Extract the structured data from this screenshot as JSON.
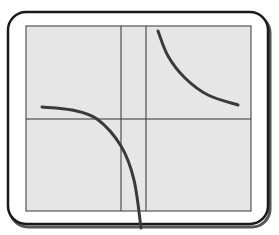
{
  "figure": {
    "title": "",
    "colors": {
      "frame": "#1a1a1a",
      "panel_fill": "#e6e6e6",
      "grid_line": "#333333",
      "curve": "#3a3a3a",
      "background": "#ffffff"
    },
    "frame": {
      "x": 8,
      "y": 12,
      "width": 260,
      "height": 212,
      "radius": 18
    },
    "panel": {
      "x": 26,
      "y": 26,
      "width": 225,
      "height": 185
    },
    "grid_lines": {
      "vertical_x": [
        121,
        146
      ],
      "horizontal_y": [
        119
      ]
    },
    "curves": [
      {
        "name": "upper-right-branch",
        "points": [
          [
            158,
            31
          ],
          [
            168,
            56
          ],
          [
            185,
            78
          ],
          [
            208,
            95
          ],
          [
            238,
            105
          ]
        ]
      },
      {
        "name": "lower-left-branch",
        "points": [
          [
            42,
            107
          ],
          [
            72,
            110
          ],
          [
            97,
            119
          ],
          [
            121,
            146
          ],
          [
            134,
            180
          ],
          [
            141,
            228
          ]
        ]
      }
    ]
  }
}
